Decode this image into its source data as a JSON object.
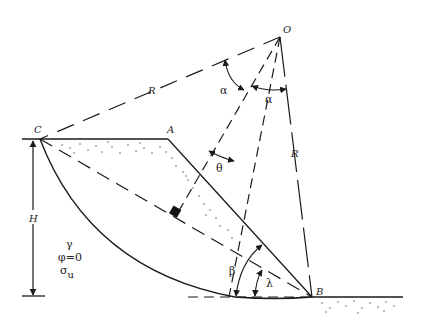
{
  "figure": {
    "type": "slope-stability-circular-failure-diagram",
    "colors": {
      "line": "#1a1a1a",
      "background": "#ffffff",
      "stipple": "#444444"
    }
  },
  "points": {
    "O": {
      "label": "O",
      "x": 280,
      "y": 37
    },
    "C": {
      "label": "C",
      "x": 40,
      "y": 139
    },
    "A": {
      "label": "A",
      "x": 168,
      "y": 139
    },
    "B": {
      "label": "B",
      "x": 312,
      "y": 297
    }
  },
  "labels": {
    "radius_left": "R",
    "radius_right": "R",
    "height": "H",
    "alpha_left": "α",
    "alpha_right": "α",
    "theta": "θ",
    "beta": "β",
    "lambda": "λ",
    "unit_weight": "γ",
    "friction_angle": "φ=0",
    "cohesion_symbol": "σ",
    "cohesion_subscript": "u"
  }
}
